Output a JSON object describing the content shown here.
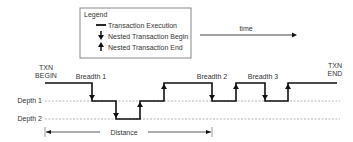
{
  "legend": {
    "title": "Legend",
    "items": [
      {
        "icon": "line-icon",
        "label": "Transaction Execution"
      },
      {
        "icon": "arrow-down-icon",
        "label": "Nested Transaction Begin"
      },
      {
        "icon": "arrow-up-icon",
        "label": "Nested Transaction End"
      }
    ]
  },
  "time_label": "time",
  "txn_begin": [
    "TXN",
    "BEGIN"
  ],
  "txn_end": [
    "TXN",
    "END"
  ],
  "breadths": [
    "Breadth 1",
    "Breadth 2",
    "Breadth 3"
  ],
  "depths": [
    "Depth 1",
    "Depth 2"
  ],
  "distance_label": "Distance",
  "colors": {
    "line": "#111111",
    "dashed": "#888888",
    "box": "#888888"
  }
}
